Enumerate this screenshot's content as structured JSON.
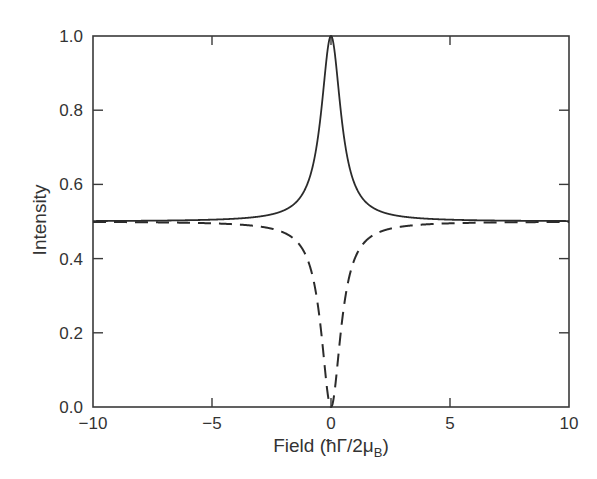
{
  "chart_data": {
    "type": "line",
    "title": "",
    "xlabel": "Field (ħΓ/2μB)",
    "xlabel_parts": {
      "main": "Field  (ħΓ/2μ",
      "sub": "B",
      "close": ")"
    },
    "ylabel": "Intensity",
    "xlim": [
      -10,
      10
    ],
    "ylim": [
      0.0,
      1.0
    ],
    "xticks": [
      -10,
      -5,
      0,
      5,
      10
    ],
    "xtick_labels": [
      "−10",
      "−5",
      "0",
      "5",
      "10"
    ],
    "yticks": [
      0.0,
      0.2,
      0.4,
      0.6,
      0.8,
      1.0
    ],
    "ytick_labels": [
      "0.0",
      "0.2",
      "0.4",
      "0.6",
      "0.8",
      "1.0"
    ],
    "grid": false,
    "legend": null,
    "series": [
      {
        "name": "solid (peak)",
        "style": "solid",
        "model": "0.5 + 0.5/(1+(x/0.5)^2)",
        "x": [
          -10,
          -5,
          -3,
          -2,
          -1,
          -0.5,
          -0.25,
          0,
          0.25,
          0.5,
          1,
          2,
          3,
          5,
          10
        ],
        "y": [
          0.501,
          0.505,
          0.514,
          0.529,
          0.6,
          0.75,
          0.9,
          1.0,
          0.9,
          0.75,
          0.6,
          0.529,
          0.514,
          0.505,
          0.501
        ]
      },
      {
        "name": "dashed (dip)",
        "style": "dashed",
        "model": "0.5 - 0.5/(1+(x/0.5)^2)",
        "x": [
          -10,
          -5,
          -3,
          -2,
          -1,
          -0.5,
          -0.25,
          0,
          0.25,
          0.5,
          1,
          2,
          3,
          5,
          10
        ],
        "y": [
          0.499,
          0.495,
          0.486,
          0.471,
          0.4,
          0.25,
          0.1,
          0.0,
          0.1,
          0.25,
          0.4,
          0.471,
          0.486,
          0.495,
          0.499
        ]
      }
    ],
    "width_hwhm": 0.5,
    "baseline": 0.5
  },
  "colors": {
    "line": "#2b2b2b",
    "axis": "#3a3a3a",
    "text": "#333333"
  }
}
